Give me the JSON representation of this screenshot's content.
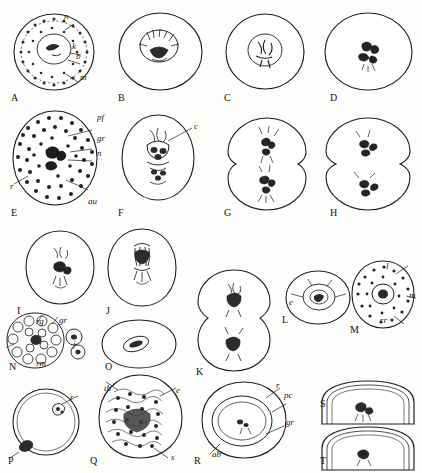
{
  "plate": {
    "title": "Cytological plate: stages of cell division (camera lucida drawings)",
    "background_color": "#fdfdfb",
    "ink_color": "#1d1d1d",
    "panel_count": 20
  },
  "panels": [
    {
      "id": "A",
      "shape": "stippled-oval",
      "labels": [
        "n",
        "k",
        "b",
        "m"
      ],
      "id_x": 11,
      "id_y": 99
    },
    {
      "id": "B",
      "shape": "rounded-cell-with-central-mass",
      "labels": [],
      "id_x": 118,
      "id_y": 99
    },
    {
      "id": "C",
      "shape": "rounded-cell-with-spindle",
      "labels": [],
      "id_x": 224,
      "id_y": 99
    },
    {
      "id": "D",
      "shape": "rounded-cell-with-chromosome-plate",
      "labels": [],
      "id_x": 330,
      "id_y": 99
    },
    {
      "id": "E",
      "shape": "large-stippled-oval",
      "labels": [
        "pf",
        "gr",
        "n",
        "r",
        "au"
      ],
      "id_x": 11,
      "id_y": 214
    },
    {
      "id": "F",
      "shape": "oval-with-spindle",
      "labels": [
        "c"
      ],
      "id_x": 118,
      "id_y": 214
    },
    {
      "id": "G",
      "shape": "dividing-cell-anaphase",
      "labels": [],
      "id_x": 224,
      "id_y": 214
    },
    {
      "id": "H",
      "shape": "dividing-cell-telophase",
      "labels": [],
      "id_x": 330,
      "id_y": 214
    },
    {
      "id": "I",
      "shape": "small-cell-dark-mass",
      "labels": [],
      "id_x": 11,
      "id_y": 312
    },
    {
      "id": "J",
      "shape": "small-cell-spindle",
      "labels": [],
      "id_x": 106,
      "id_y": 312
    },
    {
      "id": "K",
      "shape": "two-lobed-cell",
      "labels": [],
      "id_x": 196,
      "id_y": 372
    },
    {
      "id": "L",
      "shape": "rounded-cell-with-ring",
      "labels": [
        "e"
      ],
      "id_x": 282,
      "id_y": 320
    },
    {
      "id": "M",
      "shape": "stippled-cell-with-nucleus",
      "labels": [
        "l",
        "m",
        "rr"
      ],
      "id_x": 350,
      "id_y": 330
    },
    {
      "id": "N",
      "shape": "segmented-cluster",
      "labels": [
        "rg",
        "gr",
        "j",
        "rm"
      ],
      "id_x": 9,
      "id_y": 367
    },
    {
      "id": "O",
      "shape": "oval-with-elongate-body",
      "labels": [],
      "id_x": 105,
      "id_y": 367
    },
    {
      "id": "P",
      "shape": "circle-with-polar-body",
      "labels": [
        "r"
      ],
      "id_x": 8,
      "id_y": 462
    },
    {
      "id": "Q",
      "shape": "dense-granular-cell",
      "labels": [
        "th",
        "e",
        "s"
      ],
      "id_x": 90,
      "id_y": 462
    },
    {
      "id": "R",
      "shape": "oval-with-inner-oval",
      "labels": [
        "r",
        "pc",
        "gr",
        "ab"
      ],
      "id_x": 194,
      "id_y": 462
    },
    {
      "id": "S",
      "shape": "half-dome-section",
      "labels": [],
      "id_x": 320,
      "id_y": 405
    },
    {
      "id": "T",
      "shape": "half-dome-section-lower",
      "labels": [
        "m"
      ],
      "id_x": 320,
      "id_y": 462
    }
  ],
  "annotations": {
    "A": [
      {
        "text": "n",
        "x": 62,
        "y": 17
      },
      {
        "text": "k",
        "x": 70,
        "y": 47
      },
      {
        "text": "b",
        "x": 74,
        "y": 57
      },
      {
        "text": "m",
        "x": 78,
        "y": 78
      }
    ],
    "E": [
      {
        "text": "pf",
        "x": 95,
        "y": 117
      },
      {
        "text": "gr",
        "x": 95,
        "y": 137
      },
      {
        "text": "n",
        "x": 95,
        "y": 152
      },
      {
        "text": "r",
        "x": 12,
        "y": 183
      },
      {
        "text": "au",
        "x": 88,
        "y": 200
      }
    ],
    "F": [
      {
        "text": "c",
        "x": 190,
        "y": 126
      }
    ],
    "M": [
      {
        "text": "l",
        "x": 385,
        "y": 268
      },
      {
        "text": "m",
        "x": 409,
        "y": 296
      },
      {
        "text": "rr",
        "x": 380,
        "y": 321
      }
    ],
    "L": [
      {
        "text": "e",
        "x": 289,
        "y": 304
      }
    ],
    "N": [
      {
        "text": "rg",
        "x": 36,
        "y": 322
      },
      {
        "text": "gr",
        "x": 59,
        "y": 321
      },
      {
        "text": "j",
        "x": 72,
        "y": 345
      },
      {
        "text": "rm",
        "x": 36,
        "y": 364
      }
    ],
    "P": [
      {
        "text": "r",
        "x": 70,
        "y": 398
      }
    ],
    "Q": [
      {
        "text": "th",
        "x": 105,
        "y": 389
      },
      {
        "text": "e",
        "x": 175,
        "y": 391
      },
      {
        "text": "s",
        "x": 170,
        "y": 458
      }
    ],
    "R": [
      {
        "text": "r",
        "x": 274,
        "y": 386
      },
      {
        "text": "pc",
        "x": 282,
        "y": 396
      },
      {
        "text": "gr",
        "x": 284,
        "y": 423
      },
      {
        "text": "ab",
        "x": 212,
        "y": 455
      }
    ]
  }
}
